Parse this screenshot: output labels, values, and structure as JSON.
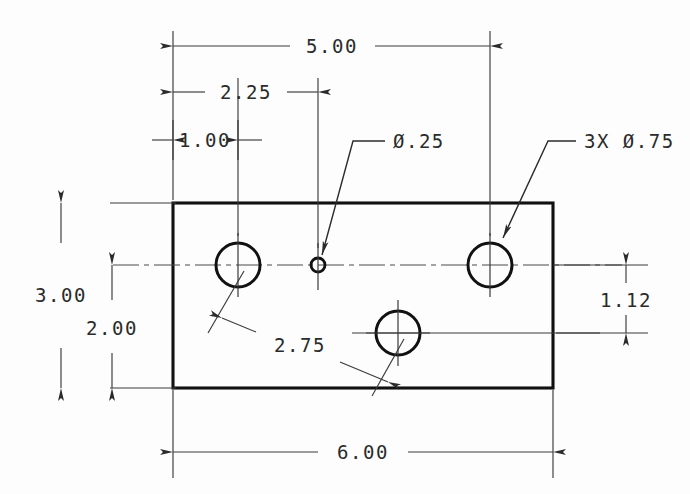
{
  "drawing": {
    "title": "Rectangular Plate Detail — Orthographic Front View",
    "units": "inches",
    "dimensions": {
      "overall_width": "6.00",
      "overall_height": "3.00",
      "top_50": "5.00",
      "top_225": "2.25",
      "top_100": "1.00",
      "left_300": "3.00",
      "left_200": "2.00",
      "bottom_600": "6.00",
      "right_112": "1.12",
      "hole_spacing_275": "2.75"
    },
    "notes": {
      "small_hole": "Ø.25",
      "large_holes": "3X Ø.75"
    },
    "labels": {
      "dim_500": "5.00",
      "dim_225": "2.25",
      "dim_100": "1.00",
      "dim_300": "3.00",
      "dim_200": "2.00",
      "dim_600": "6.00",
      "dim_112": "1.12",
      "dim_275": "2.75",
      "note_diameter_small": "Ø.25",
      "note_diameter_large": "3X Ø.75"
    },
    "colors": {
      "object_line": "#111111",
      "thin_line": "#3a3a3a",
      "text": "#2b2b2b",
      "background": "#fdfdfd"
    },
    "geometry": {
      "plate_left": 173,
      "plate_top": 203,
      "plate_right": 553,
      "plate_bottom": 388,
      "hole_left": {
        "cx": 238,
        "cy": 265,
        "r": 22
      },
      "hole_small": {
        "cx": 318,
        "cy": 265,
        "r": 7
      },
      "hole_right": {
        "cx": 490,
        "cy": 265,
        "r": 22
      },
      "hole_bottom": {
        "cx": 398,
        "cy": 333,
        "r": 22
      }
    }
  }
}
